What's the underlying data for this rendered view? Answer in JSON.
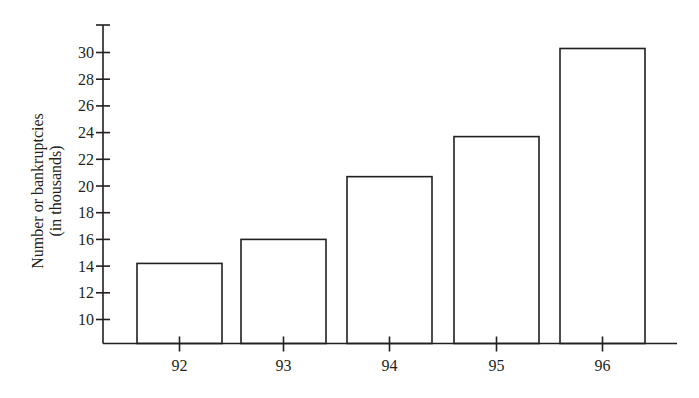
{
  "chart_data": {
    "type": "bar",
    "title": "",
    "xlabel": "",
    "ylabel": [
      "Number or bankruptcies",
      "(in thousands)"
    ],
    "categories": [
      "92",
      "93",
      "94",
      "95",
      "96"
    ],
    "values": [
      14.2,
      16.0,
      20.7,
      23.7,
      30.3
    ],
    "yticks": [
      10,
      12,
      14,
      16,
      18,
      20,
      22,
      24,
      26,
      28,
      30
    ],
    "ylim": [
      8.2,
      32
    ],
    "grid": false,
    "legend": null,
    "bar_fill": "#ffffff",
    "bar_stroke": "#231f20",
    "axis_color": "#231f20"
  }
}
